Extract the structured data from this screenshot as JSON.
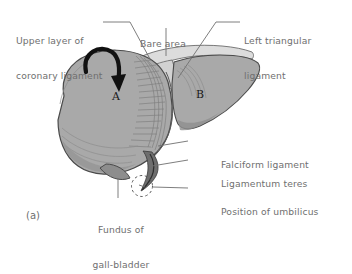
{
  "figure": {
    "panel_id": "(a)",
    "view": "anterior view of the liver",
    "fill_colors": {
      "liver_main": "#a9a9a9",
      "liver_shade": "#9a9a9a",
      "bare_area": "#dcdcdc",
      "gallbladder": "#8f8f8f",
      "outline": "#4a4a4a",
      "label_text": "#6f6f6f",
      "arrow": "#111111"
    },
    "organ_labels": [
      {
        "text": "A",
        "meaning": "right-lobe-of-liver",
        "x": 112,
        "y": 97
      },
      {
        "text": "B",
        "meaning": "left-lobe-of-liver",
        "x": 196,
        "y": 95
      }
    ],
    "callouts": [
      {
        "name": "upper-layer-of-coronary-ligament",
        "line1": "Upper layer of",
        "line2": "coronary ligament",
        "side": "top-left",
        "x": 16,
        "y": 12
      },
      {
        "name": "bare-area",
        "line1": "Bare area",
        "line2": "",
        "side": "top-center",
        "x": 150,
        "y": 15
      },
      {
        "name": "left-triangular-ligament",
        "line1": "Left triangular",
        "line2": "ligament",
        "side": "top-right",
        "x": 244,
        "y": 12
      },
      {
        "name": "falciform-ligament",
        "line1": "Falciform ligament",
        "line2": "",
        "side": "right",
        "x": 221,
        "y": 137
      },
      {
        "name": "ligamentum-teres",
        "line1": "Ligamentum teres",
        "line2": "",
        "side": "right",
        "x": 221,
        "y": 156
      },
      {
        "name": "position-of-umbilicus",
        "line1": "Position of umbilicus",
        "line2": "",
        "side": "right",
        "x": 221,
        "y": 184
      },
      {
        "name": "fundus-of-gall-bladder",
        "line1": "Fundus of",
        "line2": "gall-bladder",
        "side": "bottom",
        "x": 96,
        "y": 201
      }
    ]
  }
}
